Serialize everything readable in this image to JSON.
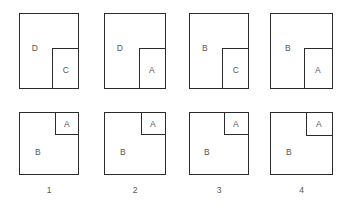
{
  "diagram": {
    "stroke_color": "#2b2b2b",
    "label_color": "#565656",
    "background_color": "#ffffff",
    "columns": [
      {
        "number": "1",
        "top": {
          "outer_label": "D",
          "inner_label": "C",
          "outer": {
            "x": 19,
            "y": 13,
            "w": 60,
            "h": 76
          },
          "inner": {
            "x": 52,
            "y": 48,
            "w": 27,
            "h": 41
          },
          "outer_label_pos": {
            "x": 35,
            "y": 48
          },
          "inner_label_pos": {
            "x": 66,
            "y": 70
          }
        },
        "bottom": {
          "outer_label": "B",
          "inner_label": "A",
          "outer": {
            "x": 19,
            "y": 112,
            "w": 60,
            "h": 63
          },
          "inner": {
            "x": 55,
            "y": 112,
            "w": 24,
            "h": 23
          },
          "outer_label_pos": {
            "x": 38,
            "y": 152
          },
          "inner_label_pos": {
            "x": 67,
            "y": 124
          }
        }
      },
      {
        "number": "2",
        "top": {
          "outer_label": "D",
          "inner_label": "A",
          "outer": {
            "x": 104,
            "y": 13,
            "w": 62,
            "h": 76
          },
          "inner": {
            "x": 139,
            "y": 48,
            "w": 27,
            "h": 41
          },
          "outer_label_pos": {
            "x": 120,
            "y": 48
          },
          "inner_label_pos": {
            "x": 152,
            "y": 70
          }
        },
        "bottom": {
          "outer_label": "B",
          "inner_label": "A",
          "outer": {
            "x": 104,
            "y": 112,
            "w": 62,
            "h": 63
          },
          "inner": {
            "x": 141,
            "y": 112,
            "w": 25,
            "h": 23
          },
          "outer_label_pos": {
            "x": 123,
            "y": 152
          },
          "inner_label_pos": {
            "x": 153,
            "y": 124
          }
        }
      },
      {
        "number": "3",
        "top": {
          "outer_label": "B",
          "inner_label": "C",
          "outer": {
            "x": 189,
            "y": 13,
            "w": 60,
            "h": 76
          },
          "inner": {
            "x": 222,
            "y": 48,
            "w": 27,
            "h": 41
          },
          "outer_label_pos": {
            "x": 205,
            "y": 48
          },
          "inner_label_pos": {
            "x": 236,
            "y": 70
          }
        },
        "bottom": {
          "outer_label": "B",
          "inner_label": "A",
          "outer": {
            "x": 189,
            "y": 112,
            "w": 60,
            "h": 63
          },
          "inner": {
            "x": 224,
            "y": 112,
            "w": 25,
            "h": 23
          },
          "outer_label_pos": {
            "x": 207,
            "y": 152
          },
          "inner_label_pos": {
            "x": 236,
            "y": 124
          }
        }
      },
      {
        "number": "4",
        "top": {
          "outer_label": "B",
          "inner_label": "A",
          "outer": {
            "x": 270,
            "y": 13,
            "w": 63,
            "h": 76
          },
          "inner": {
            "x": 304,
            "y": 48,
            "w": 29,
            "h": 41
          },
          "outer_label_pos": {
            "x": 288,
            "y": 48
          },
          "inner_label_pos": {
            "x": 318,
            "y": 70
          }
        },
        "bottom": {
          "outer_label": "B",
          "inner_label": "A",
          "outer": {
            "x": 270,
            "y": 112,
            "w": 63,
            "h": 63
          },
          "inner": {
            "x": 306,
            "y": 112,
            "w": 27,
            "h": 24
          },
          "outer_label_pos": {
            "x": 289,
            "y": 152
          },
          "inner_label_pos": {
            "x": 319,
            "y": 124
          }
        }
      }
    ]
  }
}
